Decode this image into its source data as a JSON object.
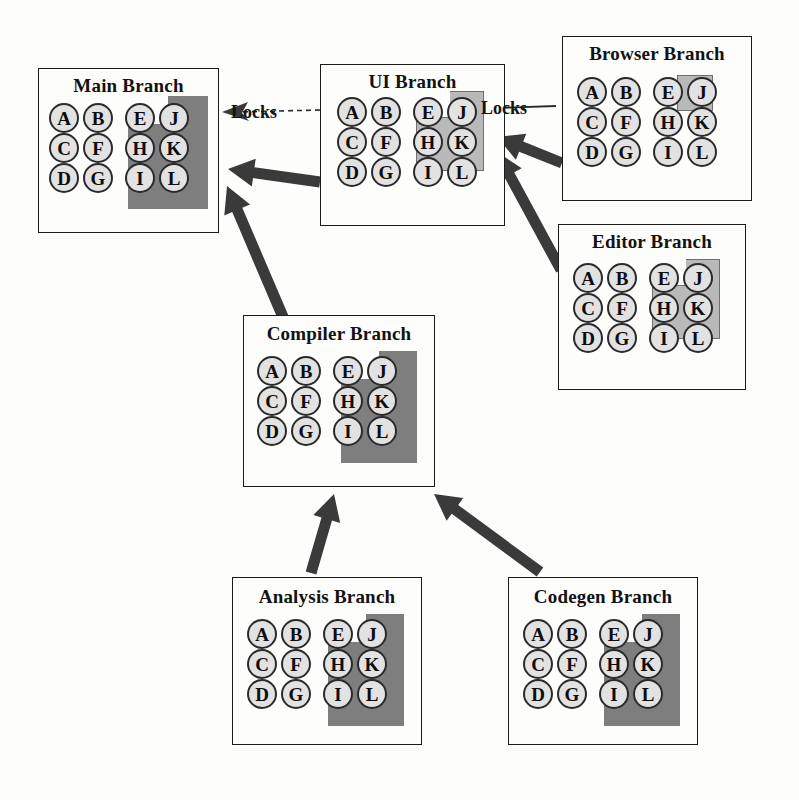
{
  "diagram": {
    "colors": {
      "region_dark": "#7e7e7e",
      "region_light": "#b9b9b9",
      "node_fill": "#e2e2e2",
      "node_stroke": "#2a2a2a",
      "arrow": "#3a3a3a",
      "box_stroke": "#1a1a1a",
      "background": "#fdfdfc"
    },
    "node_letters": {
      "row1": [
        "A",
        "B",
        "E",
        "J"
      ],
      "row2": [
        "C",
        "F",
        "H",
        "K"
      ],
      "row3": [
        "D",
        "G",
        "I",
        "L"
      ]
    },
    "branches": [
      {
        "id": "main",
        "title": "Main Branch",
        "box": {
          "x": 38,
          "y": 68,
          "w": 181,
          "h": 165
        },
        "title_y": 74,
        "grid": {
          "x": 48,
          "y": 102,
          "col_gap": 34,
          "row_gap": 30,
          "node_size": 30,
          "split_gap": 8
        },
        "region": {
          "style": "dark",
          "x": 127,
          "y": 95,
          "w": 80,
          "h": 113,
          "notch_w": 40,
          "notch_h": 28
        },
        "nodes_highlighted": [
          "E",
          "J",
          "H",
          "K",
          "I",
          "L"
        ]
      },
      {
        "id": "ui",
        "title": "UI Branch",
        "box": {
          "x": 320,
          "y": 64,
          "w": 185,
          "h": 162
        },
        "title_y": 70,
        "grid": {
          "x": 336,
          "y": 96,
          "col_gap": 34,
          "row_gap": 30,
          "node_size": 30,
          "split_gap": 8
        },
        "region": {
          "style": "light",
          "x": 415,
          "y": 90,
          "w": 68,
          "h": 80,
          "notch_w": 34,
          "notch_h": 26
        },
        "nodes_highlighted": [
          "E",
          "J",
          "H",
          "K"
        ]
      },
      {
        "id": "browser",
        "title": "Browser Branch",
        "box": {
          "x": 562,
          "y": 36,
          "w": 190,
          "h": 165
        },
        "title_y": 42,
        "grid": {
          "x": 576,
          "y": 76,
          "col_gap": 34,
          "row_gap": 30,
          "node_size": 30,
          "split_gap": 8
        },
        "region": {
          "style": "light",
          "x": 676,
          "y": 74,
          "w": 36,
          "h": 36,
          "notch_w": 0,
          "notch_h": 0
        },
        "nodes_highlighted": [
          "J"
        ]
      },
      {
        "id": "editor",
        "title": "Editor Branch",
        "box": {
          "x": 558,
          "y": 224,
          "w": 188,
          "h": 166
        },
        "title_y": 230,
        "grid": {
          "x": 572,
          "y": 262,
          "col_gap": 34,
          "row_gap": 30,
          "node_size": 30,
          "split_gap": 8
        },
        "region": {
          "style": "light",
          "x": 651,
          "y": 258,
          "w": 68,
          "h": 80,
          "notch_w": 34,
          "notch_h": 26
        },
        "nodes_highlighted": [
          "E",
          "J",
          "H",
          "K"
        ]
      },
      {
        "id": "compiler",
        "title": "Compiler Branch",
        "box": {
          "x": 243,
          "y": 315,
          "w": 192,
          "h": 172
        },
        "title_y": 322,
        "grid": {
          "x": 256,
          "y": 355,
          "col_gap": 34,
          "row_gap": 30,
          "node_size": 30,
          "split_gap": 8
        },
        "region": {
          "style": "dark",
          "x": 340,
          "y": 350,
          "w": 76,
          "h": 112,
          "notch_w": 38,
          "notch_h": 28
        },
        "nodes_highlighted": [
          "E",
          "J",
          "H",
          "K",
          "I",
          "L"
        ]
      },
      {
        "id": "analysis",
        "title": "Analysis Branch",
        "box": {
          "x": 232,
          "y": 577,
          "w": 190,
          "h": 168
        },
        "title_y": 585,
        "grid": {
          "x": 246,
          "y": 618,
          "col_gap": 34,
          "row_gap": 30,
          "node_size": 30,
          "split_gap": 8
        },
        "region": {
          "style": "dark",
          "x": 327,
          "y": 613,
          "w": 76,
          "h": 112,
          "notch_w": 38,
          "notch_h": 28
        },
        "nodes_highlighted": [
          "E",
          "J",
          "H",
          "K",
          "I",
          "L"
        ]
      },
      {
        "id": "codegen",
        "title": "Codegen Branch",
        "box": {
          "x": 508,
          "y": 577,
          "w": 190,
          "h": 168
        },
        "title_y": 585,
        "grid": {
          "x": 522,
          "y": 618,
          "col_gap": 34,
          "row_gap": 30,
          "node_size": 30,
          "split_gap": 8
        },
        "region": {
          "style": "dark",
          "x": 603,
          "y": 613,
          "w": 76,
          "h": 112,
          "notch_w": 38,
          "notch_h": 28
        },
        "nodes_highlighted": [
          "E",
          "J",
          "H",
          "K",
          "I",
          "L"
        ]
      }
    ],
    "lock_labels": [
      {
        "id": "lock-main",
        "text": "Locks",
        "x": 231,
        "y": 102
      },
      {
        "id": "lock-ui",
        "text": "Locks",
        "x": 481,
        "y": 98
      }
    ],
    "lock_connectors": [
      {
        "id": "lock-connector-main",
        "from_x": 320,
        "from_y": 110,
        "to_x": 222,
        "to_y": 112,
        "style": "dashed",
        "arrow": "left"
      },
      {
        "id": "lock-connector-ui",
        "from_x": 556,
        "from_y": 106,
        "to_x": 478,
        "to_y": 108,
        "style": "solid-thin",
        "arrow": "left"
      }
    ],
    "merge_arrows": [
      {
        "id": "arrow-ui-to-main",
        "from": "ui",
        "to": "main",
        "from_x": 320,
        "from_y": 182,
        "to_x": 228,
        "to_y": 169
      },
      {
        "id": "arrow-compiler-to-main",
        "from": "compiler",
        "to": "main",
        "from_x": 283,
        "from_y": 317,
        "to_x": 227,
        "to_y": 186
      },
      {
        "id": "arrow-browser-to-ui",
        "from": "browser",
        "to": "ui",
        "from_x": 562,
        "from_y": 163,
        "to_x": 497,
        "to_y": 137
      },
      {
        "id": "arrow-editor-to-ui",
        "from": "editor",
        "to": "ui",
        "from_x": 561,
        "from_y": 270,
        "to_x": 497,
        "to_y": 152
      },
      {
        "id": "arrow-analysis-to-compiler",
        "from": "analysis",
        "to": "compiler",
        "from_x": 311,
        "from_y": 573,
        "to_x": 334,
        "to_y": 494
      },
      {
        "id": "arrow-codegen-to-compiler",
        "from": "codegen",
        "to": "compiler",
        "from_x": 540,
        "from_y": 572,
        "to_x": 434,
        "to_y": 494
      }
    ]
  }
}
